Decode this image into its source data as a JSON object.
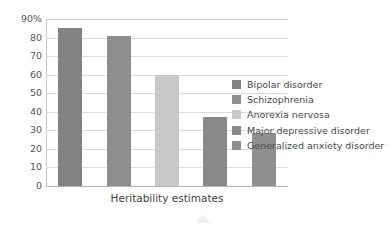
{
  "chart_data": {
    "type": "bar",
    "title": "",
    "xlabel": "Heritability estimates",
    "ylabel": "",
    "categories": [
      "Bipolar disorder",
      "Schizophrenia",
      "Anorexia nervosa",
      "Major depressive disorder",
      "Generalized anxiety disorder"
    ],
    "values": [
      85,
      81,
      60,
      37,
      28.5
    ],
    "ylim": [
      0,
      90
    ],
    "ytick_labels": [
      "90%",
      "80",
      "70",
      "60",
      "50",
      "40",
      "30",
      "20",
      "10",
      "0"
    ],
    "ytick_values": [
      90,
      80,
      70,
      60,
      50,
      40,
      30,
      20,
      10,
      0
    ],
    "grid": true,
    "legend_position": "right",
    "colors": [
      "#828282",
      "#8e8e8e",
      "#c8c8c8",
      "#8a8a8a",
      "#909090"
    ]
  },
  "legend": {
    "items": [
      {
        "label": "Bipolar disorder",
        "color": "#828282"
      },
      {
        "label": "Schizophrenia",
        "color": "#8e8e8e"
      },
      {
        "label": "Anorexia nervosa",
        "color": "#c8c8c8"
      },
      {
        "label": "Major depressive disorder",
        "color": "#8a8a8a"
      },
      {
        "label": "Generalized anxiety disorder",
        "color": "#909090"
      }
    ]
  }
}
